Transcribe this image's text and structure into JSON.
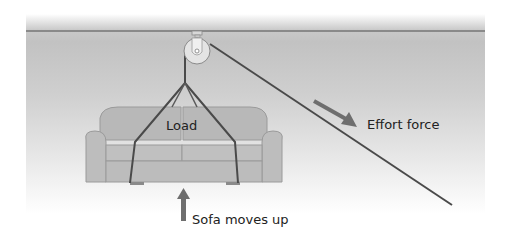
{
  "diagram": {
    "labels": {
      "load": "Load",
      "effort": "Effort force",
      "motion": "Sofa moves up"
    },
    "colors": {
      "background_gray": "#c4c4c4",
      "ceiling_line": "#8a8a8a",
      "rope": "#4a4a4a",
      "arrow": "#6e6e6e",
      "sofa_fill": "#b9b9b9",
      "sofa_outline": "#8f8f8f",
      "pulley_fill": "#e2e2e2",
      "text": "#222222"
    },
    "components": [
      "ceiling",
      "pulley",
      "rope",
      "sofa",
      "effort-arrow",
      "motion-arrow"
    ]
  }
}
